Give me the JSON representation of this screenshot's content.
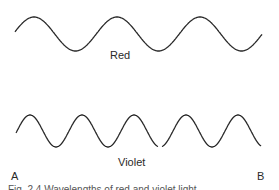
{
  "figure": {
    "waves": [
      {
        "name": "red-wave",
        "label": "Red",
        "x_start": 15,
        "x_end": 262,
        "center_y": 34,
        "amplitude": 17,
        "period": 83,
        "phase_peak_x": 34,
        "stroke": "#2a2a2a"
      },
      {
        "name": "violet-wave",
        "label": "Violet",
        "x_start": 16,
        "x_end": 261,
        "center_y": 131,
        "amplitude": 16,
        "period": 52,
        "phase_peak_x": 30,
        "stroke": "#2a2a2a",
        "gap_x": [
          158,
          162
        ]
      }
    ],
    "endpoints": {
      "left": "A",
      "right": "B"
    },
    "caption": "Fig. 2.4  Wavelengths of red and violet light"
  }
}
